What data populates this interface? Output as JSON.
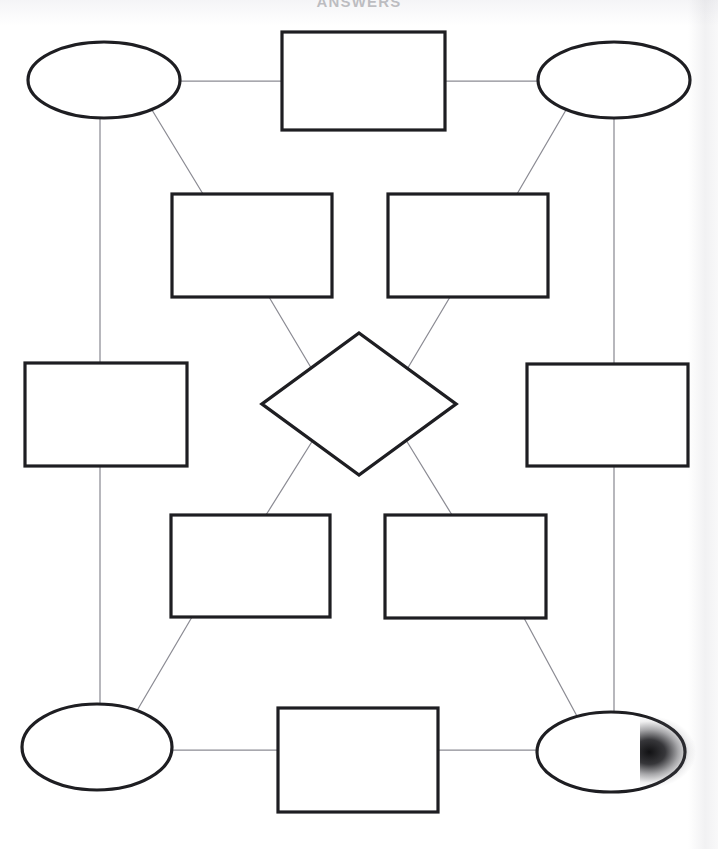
{
  "document": {
    "title": "ANSWERS",
    "kind": "blank-concept-map-worksheet",
    "page_width": 718,
    "page_height": 849,
    "background_color": "#ffffff",
    "shape_stroke_color": "#1e1e22",
    "connector_stroke_color": "#8c8c94",
    "shape_fill_color": "#ffffff"
  },
  "diagram": {
    "shape_count": 12,
    "connector_count": 16,
    "nodes": [
      {
        "id": "node-top-left-ellipse",
        "name": "top-left-ellipse",
        "type": "ellipse",
        "label": "",
        "cx": 104,
        "cy": 80,
        "rx": 76,
        "ry": 38,
        "stroke_width": 3.2
      },
      {
        "id": "node-top-center-rectangle",
        "name": "top-center-rectangle",
        "type": "rectangle",
        "label": "",
        "x": 282,
        "y": 32,
        "w": 163,
        "h": 98,
        "stroke_width": 3.2
      },
      {
        "id": "node-top-right-ellipse",
        "name": "top-right-ellipse",
        "type": "ellipse",
        "label": "",
        "cx": 614,
        "cy": 80,
        "rx": 76,
        "ry": 38,
        "stroke_width": 3.2
      },
      {
        "id": "node-upper-left-rectangle",
        "name": "upper-left-rectangle",
        "type": "rectangle",
        "label": "",
        "x": 172,
        "y": 194,
        "w": 160,
        "h": 103,
        "stroke_width": 3.2
      },
      {
        "id": "node-upper-right-rectangle",
        "name": "upper-right-rectangle",
        "type": "rectangle",
        "label": "",
        "x": 388,
        "y": 194,
        "w": 160,
        "h": 103,
        "stroke_width": 3.2
      },
      {
        "id": "node-center-diamond",
        "name": "center-diamond",
        "type": "diamond",
        "label": "",
        "cx": 359,
        "cy": 404,
        "rx": 97,
        "ry": 71,
        "stroke_width": 3.4
      },
      {
        "id": "node-middle-left-rectangle",
        "name": "middle-left-rectangle",
        "type": "rectangle",
        "label": "",
        "x": 25,
        "y": 363,
        "w": 162,
        "h": 103,
        "stroke_width": 3.2
      },
      {
        "id": "node-middle-right-rectangle",
        "name": "middle-right-rectangle",
        "type": "rectangle",
        "label": "",
        "x": 527,
        "y": 364,
        "w": 161,
        "h": 102,
        "stroke_width": 3.2
      },
      {
        "id": "node-lower-left-rectangle",
        "name": "lower-left-rectangle",
        "type": "rectangle",
        "label": "",
        "x": 171,
        "y": 515,
        "w": 159,
        "h": 102,
        "stroke_width": 3.2
      },
      {
        "id": "node-lower-right-rectangle",
        "name": "lower-right-rectangle",
        "type": "rectangle",
        "label": "",
        "x": 385,
        "y": 515,
        "w": 161,
        "h": 103,
        "stroke_width": 3.2
      },
      {
        "id": "node-bottom-left-ellipse",
        "name": "bottom-left-ellipse",
        "type": "ellipse",
        "label": "",
        "cx": 97,
        "cy": 747,
        "rx": 75,
        "ry": 43,
        "stroke_width": 3.2
      },
      {
        "id": "node-bottom-center-rectangle",
        "name": "bottom-center-rectangle",
        "type": "rectangle",
        "label": "",
        "x": 278,
        "y": 708,
        "w": 160,
        "h": 104,
        "stroke_width": 3.2
      },
      {
        "id": "node-bottom-right-ellipse",
        "name": "bottom-right-ellipse",
        "type": "ellipse",
        "label": "",
        "cx": 611,
        "cy": 752,
        "rx": 74,
        "ry": 40,
        "stroke_width": 3.2
      }
    ],
    "connectors": [
      {
        "id": "conn-1",
        "name": "connector-top-left-ellipse-to-top-center-rectangle",
        "from": "node-top-left-ellipse",
        "to": "node-top-center-rectangle",
        "x1": 180,
        "y1": 81,
        "x2": 282,
        "y2": 81
      },
      {
        "id": "conn-2",
        "name": "connector-top-center-rectangle-to-top-right-ellipse",
        "from": "node-top-center-rectangle",
        "to": "node-top-right-ellipse",
        "x1": 445,
        "y1": 81,
        "x2": 538,
        "y2": 81
      },
      {
        "id": "conn-3",
        "name": "connector-top-left-ellipse-to-middle-left-rectangle",
        "from": "node-top-left-ellipse",
        "to": "node-middle-left-rectangle",
        "x1": 100,
        "y1": 118,
        "x2": 100,
        "y2": 363
      },
      {
        "id": "conn-4",
        "name": "connector-top-left-ellipse-to-upper-left-rectangle",
        "from": "node-top-left-ellipse",
        "to": "node-upper-left-rectangle",
        "x1": 152,
        "y1": 110,
        "x2": 203,
        "y2": 194
      },
      {
        "id": "conn-5",
        "name": "connector-top-right-ellipse-to-upper-right-rectangle",
        "from": "node-top-right-ellipse",
        "to": "node-upper-right-rectangle",
        "x1": 566,
        "y1": 110,
        "x2": 517,
        "y2": 194
      },
      {
        "id": "conn-6",
        "name": "connector-top-right-ellipse-to-middle-right-rectangle",
        "from": "node-top-right-ellipse",
        "to": "node-middle-right-rectangle",
        "x1": 614,
        "y1": 118,
        "x2": 614,
        "y2": 364
      },
      {
        "id": "conn-7",
        "name": "connector-upper-left-rectangle-to-center-diamond",
        "from": "node-upper-left-rectangle",
        "to": "node-center-diamond",
        "x1": 269,
        "y1": 297,
        "x2": 313,
        "y2": 371
      },
      {
        "id": "conn-8",
        "name": "connector-upper-right-rectangle-to-center-diamond",
        "from": "node-upper-right-rectangle",
        "to": "node-center-diamond",
        "x1": 450,
        "y1": 297,
        "x2": 406,
        "y2": 371
      },
      {
        "id": "conn-9",
        "name": "connector-center-diamond-to-lower-left-rectangle",
        "from": "node-center-diamond",
        "to": "node-lower-left-rectangle",
        "x1": 313,
        "y1": 440,
        "x2": 266,
        "y2": 515
      },
      {
        "id": "conn-10",
        "name": "connector-center-diamond-to-lower-right-rectangle",
        "from": "node-center-diamond",
        "to": "node-lower-right-rectangle",
        "x1": 406,
        "y1": 440,
        "x2": 452,
        "y2": 515
      },
      {
        "id": "conn-11",
        "name": "connector-lower-left-rectangle-to-bottom-left-ellipse",
        "from": "node-lower-left-rectangle",
        "to": "node-bottom-left-ellipse",
        "x1": 192,
        "y1": 617,
        "x2": 135,
        "y2": 714
      },
      {
        "id": "conn-12",
        "name": "connector-lower-right-rectangle-to-bottom-right-ellipse",
        "from": "node-lower-right-rectangle",
        "to": "node-bottom-right-ellipse",
        "x1": 524,
        "y1": 618,
        "x2": 578,
        "y2": 718
      },
      {
        "id": "conn-13",
        "name": "connector-middle-left-rectangle-to-bottom-left-ellipse",
        "from": "node-middle-left-rectangle",
        "to": "node-bottom-left-ellipse",
        "x1": 100,
        "y1": 466,
        "x2": 100,
        "y2": 705
      },
      {
        "id": "conn-14",
        "name": "connector-middle-right-rectangle-to-bottom-right-ellipse",
        "from": "node-middle-right-rectangle",
        "to": "node-bottom-right-ellipse",
        "x1": 614,
        "y1": 466,
        "x2": 614,
        "y2": 713
      },
      {
        "id": "conn-15",
        "name": "connector-bottom-left-ellipse-to-bottom-center-rectangle",
        "from": "node-bottom-left-ellipse",
        "to": "node-bottom-center-rectangle",
        "x1": 172,
        "y1": 750,
        "x2": 278,
        "y2": 750
      },
      {
        "id": "conn-16",
        "name": "connector-bottom-center-rectangle-to-bottom-right-ellipse",
        "from": "node-bottom-center-rectangle",
        "to": "node-bottom-right-ellipse",
        "x1": 438,
        "y1": 750,
        "x2": 537,
        "y2": 750
      }
    ]
  },
  "artifacts": {
    "right_edge_shadow": "page-curl-gradient",
    "dark_wedge": {
      "x": 640,
      "y": 716,
      "w": 78,
      "h": 72
    }
  }
}
